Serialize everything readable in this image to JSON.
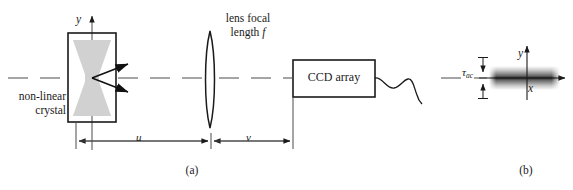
{
  "figure": {
    "width": 573,
    "height": 190,
    "background": "#ffffff",
    "ink_color": "#1a1a1a",
    "beam_color": "#c9c9c9"
  },
  "panel_a": {
    "caption": "(a)",
    "crystal": {
      "label_line1": "non-linear",
      "label_line2": "crystal",
      "box": {
        "x": 68,
        "y": 33,
        "width": 48,
        "height": 89
      }
    },
    "axis_y_label": "y",
    "lens": {
      "label_line1": "lens focal",
      "label_line2": "length",
      "label_symbol": "f",
      "center_x": 210,
      "top_y": 31,
      "bottom_y": 128
    },
    "detector": {
      "label": "CCD array",
      "box": {
        "x": 293,
        "y": 60,
        "width": 82,
        "height": 37
      }
    },
    "dimensions": [
      {
        "name": "object-distance",
        "label": "u",
        "from_x": 76,
        "to_x": 211
      },
      {
        "name": "image-distance",
        "label": "v",
        "from_x": 211,
        "to_x": 293
      }
    ],
    "optical_axis_y": 78
  },
  "panel_b": {
    "caption": "(b)",
    "axis_y_label": "y",
    "axis_x_label": "x",
    "tau_symbol": "τ",
    "tau_subscript": "ac",
    "trace": {
      "center_x": 534,
      "center_y": 78,
      "bar_left": 489,
      "bar_right": 560,
      "bar_half_height": 9
    }
  }
}
